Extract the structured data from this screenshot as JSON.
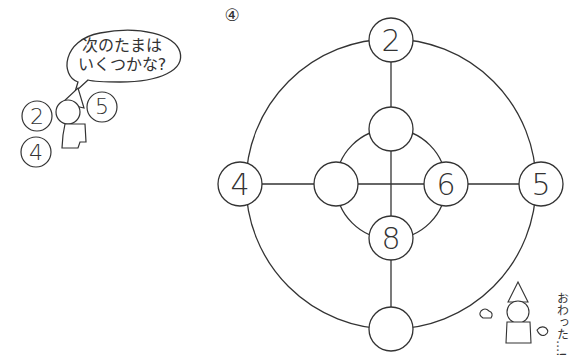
{
  "problem_label": "④",
  "speech_bubble": {
    "line1": "次のたまは",
    "line2": "いくつかな?"
  },
  "character_balls": [
    "2",
    "5",
    "4"
  ],
  "ending_text": "おわった…!",
  "diagram": {
    "outer_nodes": {
      "top": "2",
      "left": "4",
      "right": "5",
      "bottom": ""
    },
    "inner_nodes": {
      "top": "",
      "left": "",
      "right": "6",
      "bottom": "8"
    }
  }
}
